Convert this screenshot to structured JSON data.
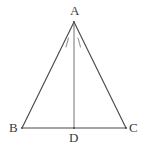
{
  "figure": {
    "background_color": "#ffffff",
    "stroke_color": "#4a4a4a",
    "mark_color": "#8c8c8c",
    "label_color": "#3a3a3a",
    "vertices": {
      "A": {
        "label": "A",
        "x": 74,
        "y": 22
      },
      "B": {
        "label": "B",
        "x": 22,
        "y": 128
      },
      "C": {
        "label": "C",
        "x": 126,
        "y": 128
      },
      "D": {
        "label": "D",
        "x": 74,
        "y": 128
      }
    },
    "segments": [
      {
        "name": "AB",
        "from": "A",
        "to": "B"
      },
      {
        "name": "AC",
        "from": "A",
        "to": "C"
      },
      {
        "name": "BC",
        "from": "B",
        "to": "C"
      },
      {
        "name": "AD",
        "from": "A",
        "to": "D"
      }
    ],
    "angle_marks": [
      {
        "name": "angle-BAD-mark",
        "x1": 66,
        "y1": 47,
        "x2": 68,
        "y2": 38
      },
      {
        "name": "angle-DAC-mark",
        "x1": 80,
        "y1": 47,
        "x2": 78,
        "y2": 38
      }
    ]
  }
}
